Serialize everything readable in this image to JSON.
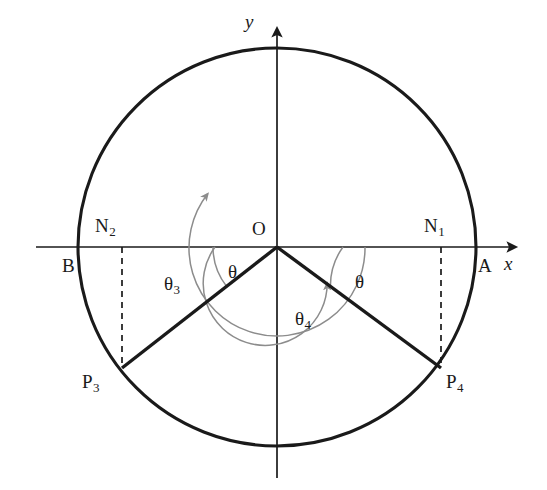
{
  "figure": {
    "width": 547,
    "height": 490,
    "background": "#ffffff",
    "stroke_dark": "#1a1a1a",
    "stroke_gray": "#8c8c8c"
  },
  "axes": {
    "x_label": "x",
    "y_label": "y",
    "x_axis_y": 247,
    "y_axis_x": 277,
    "x_axis_from": 36,
    "x_axis_to": 522,
    "y_axis_from": 22,
    "y_axis_to": 478
  },
  "circle": {
    "center_x": 277,
    "center_y": 247,
    "radius": 199
  },
  "points": [
    {
      "name": "O",
      "label": "O",
      "sub": "",
      "x": 277,
      "y": 247,
      "label_x": 252,
      "label_y": 219
    },
    {
      "name": "A",
      "label": "A",
      "sub": "",
      "x": 476,
      "y": 247,
      "label_x": 478,
      "label_y": 256
    },
    {
      "name": "B",
      "label": "B",
      "sub": "",
      "x": 78,
      "y": 247,
      "label_x": 62,
      "label_y": 256
    },
    {
      "name": "N1",
      "label": "N",
      "sub": "1",
      "x": 441,
      "y": 247,
      "label_x": 424,
      "label_y": 216
    },
    {
      "name": "N2",
      "label": "N",
      "sub": "2",
      "x": 122,
      "y": 247,
      "label_x": 95,
      "label_y": 216
    },
    {
      "name": "P3",
      "label": "P",
      "sub": "3",
      "x": 122,
      "y": 368,
      "label_x": 82,
      "label_y": 372
    },
    {
      "name": "P4",
      "label": "P",
      "sub": "4",
      "x": 441,
      "y": 368,
      "label_x": 446,
      "label_y": 372
    }
  ],
  "radii": [
    {
      "name": "radius-to-P3",
      "from": "O",
      "to": "P3",
      "x1": 277,
      "y1": 247,
      "x2": 122,
      "y2": 368
    },
    {
      "name": "radius-to-P4",
      "from": "O",
      "to": "P4",
      "x1": 277,
      "y1": 247,
      "x2": 441,
      "y2": 368
    }
  ],
  "dashed_lines": [
    {
      "name": "perp-N2-P3",
      "x1": 122,
      "y1": 247,
      "x2": 122,
      "y2": 368
    },
    {
      "name": "perp-N1-P4",
      "x1": 441,
      "y1": 247,
      "x2": 441,
      "y2": 368
    }
  ],
  "angles": [
    {
      "name": "theta-left",
      "label": "θ",
      "sub": "",
      "label_x": 228,
      "label_y": 262,
      "radius": 64,
      "start_deg": 180,
      "end_deg": 218,
      "note": "small angle between negative x-axis and radius OP3"
    },
    {
      "name": "theta-right",
      "label": "θ",
      "sub": "",
      "label_x": 355,
      "label_y": 272,
      "radius": 66,
      "start_deg": 0,
      "end_deg": -36,
      "note": "small angle between positive x-axis and radius OP4"
    },
    {
      "name": "theta-3",
      "label": "θ",
      "sub": "3",
      "label_x": 164,
      "label_y": 274,
      "radius": 88,
      "start_deg": 0,
      "end_deg": 218,
      "direction": "counterclockwise",
      "note": "swept angle from positive x-axis counterclockwise to radius OP3"
    },
    {
      "name": "theta-4",
      "label": "θ",
      "sub": "4",
      "label_x": 295,
      "label_y": 309,
      "radius": 62,
      "start_deg": 180,
      "end_deg": 324,
      "direction": "clockwise",
      "note": "swept angle from negative x-axis clockwise to radius OP4"
    }
  ]
}
